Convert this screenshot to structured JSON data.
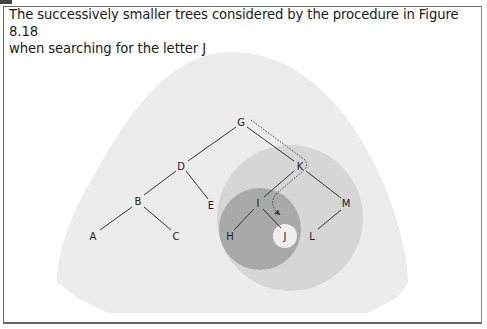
{
  "figure": {
    "caption_line1": "The successively smaller trees considered by the procedure in Figure 8.18",
    "caption_line2": "when searching for the letter J",
    "search_target": "J",
    "colors": {
      "outer_region": "#ececec",
      "subtree_K": "#d4d4d4",
      "subtree_I": "#a9a9a9",
      "subtree_J": "#efefef",
      "edge": "#333333",
      "search_path": "#444444"
    },
    "nodes": [
      {
        "id": "G",
        "label": "G"
      },
      {
        "id": "D",
        "label": "D"
      },
      {
        "id": "K",
        "label": "K"
      },
      {
        "id": "B",
        "label": "B"
      },
      {
        "id": "E",
        "label": "E"
      },
      {
        "id": "I",
        "label": "I"
      },
      {
        "id": "M",
        "label": "M"
      },
      {
        "id": "A",
        "label": "A"
      },
      {
        "id": "C",
        "label": "C"
      },
      {
        "id": "H",
        "label": "H"
      },
      {
        "id": "J",
        "label": "J"
      },
      {
        "id": "L",
        "label": "L"
      }
    ],
    "edges": [
      [
        "G",
        "D"
      ],
      [
        "G",
        "K"
      ],
      [
        "D",
        "B"
      ],
      [
        "D",
        "E"
      ],
      [
        "B",
        "A"
      ],
      [
        "B",
        "C"
      ],
      [
        "K",
        "I"
      ],
      [
        "K",
        "M"
      ],
      [
        "I",
        "H"
      ],
      [
        "I",
        "J"
      ],
      [
        "M",
        "L"
      ]
    ],
    "search_path": [
      "G",
      "K",
      "I",
      "J"
    ],
    "regions": [
      {
        "name": "whole-tree",
        "root": "G"
      },
      {
        "name": "subtree-K",
        "root": "K"
      },
      {
        "name": "subtree-I",
        "root": "I"
      },
      {
        "name": "subtree-J",
        "root": "J"
      }
    ]
  }
}
